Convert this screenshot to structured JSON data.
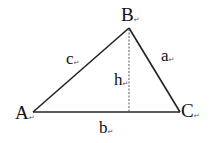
{
  "figure": {
    "type": "triangle",
    "vertices": [
      {
        "label": "A",
        "x": 33,
        "y": 112
      },
      {
        "label": "B",
        "x": 129,
        "y": 28
      },
      {
        "label": "C",
        "x": 180,
        "y": 112
      }
    ],
    "sides": [
      {
        "label": "c",
        "from": "A",
        "to": "B"
      },
      {
        "label": "a",
        "from": "B",
        "to": "C"
      },
      {
        "label": "b",
        "from": "A",
        "to": "C"
      }
    ],
    "altitude": {
      "label": "h",
      "from": "B",
      "style": "dashed"
    },
    "line_color": "#222222",
    "return_mark": "↵"
  },
  "labels": {
    "A": "A",
    "B": "B",
    "C": "C",
    "a": "a",
    "b": "b",
    "c": "c",
    "h": "h"
  }
}
